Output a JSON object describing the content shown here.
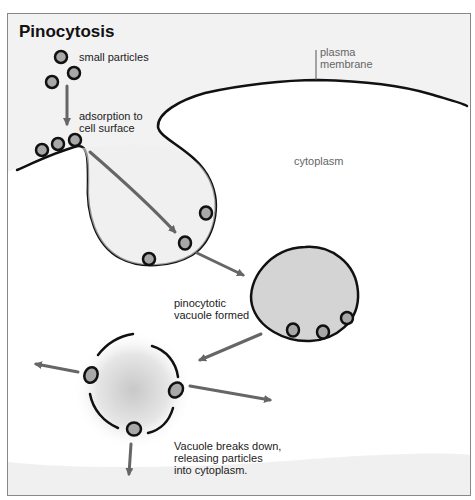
{
  "title": "Pinocytosis",
  "labels": {
    "small_particles": "small particles",
    "adsorption": "adsorption to\ncell surface",
    "plasma_membrane": "plasma\nmembrane",
    "cytoplasm": "cytoplasm",
    "vacuole_formed": "pinocytotic\nvacuole formed",
    "breaks_down": "Vacuole breaks down,\nreleasing particles\ninto cytoplasm."
  },
  "colors": {
    "background_outside": "#f2f2f2",
    "cytoplasm": "#ffffff",
    "vacuole_fill": "#d4d4d4",
    "particle_fill": "#a8a8a8",
    "outline": "#111111",
    "arrow": "#666666",
    "frame": "#888888"
  },
  "stages": [
    "small particles",
    "adsorption to cell surface",
    "invagination",
    "pinocytotic vacuole formed",
    "vacuole breaks down, releasing particles into cytoplasm"
  ]
}
